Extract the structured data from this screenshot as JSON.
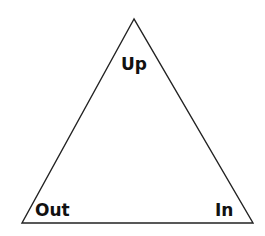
{
  "diagram": {
    "shape": "triangle",
    "stroke_color": "#222222",
    "labels": {
      "top": "Up",
      "bottom_left": "Out",
      "bottom_right": "In"
    }
  }
}
